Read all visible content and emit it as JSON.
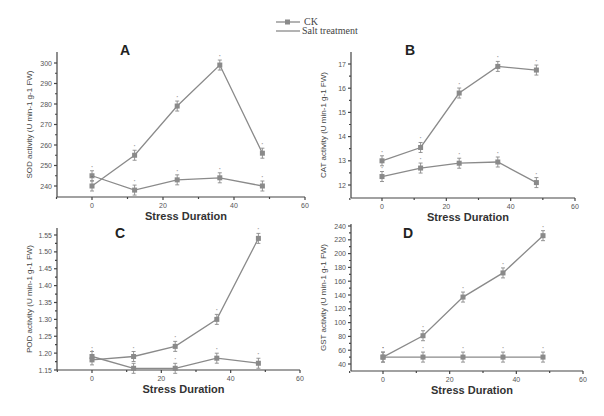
{
  "legend": {
    "entries": [
      {
        "label": "CK",
        "marker": "square"
      },
      {
        "label": "Salt treatment",
        "marker": "none"
      }
    ]
  },
  "chart_data": [
    {
      "panel": "A",
      "type": "line",
      "title": "A",
      "xlabel": "Stress Duration",
      "ylabel": "SOD activity (U min-1 g-1 FW)",
      "x": [
        0,
        12,
        24,
        36,
        48
      ],
      "xlim": [
        -10,
        60
      ],
      "xticks": [
        0,
        20,
        40,
        60
      ],
      "ylim": [
        236,
        302
      ],
      "yticks": [
        240,
        250,
        260,
        270,
        280,
        290,
        300
      ],
      "series": [
        {
          "name": "CK",
          "values": [
            245,
            238,
            243,
            244,
            240
          ]
        },
        {
          "name": "Salt treatment",
          "values": [
            240,
            255,
            279,
            299,
            256
          ]
        }
      ]
    },
    {
      "panel": "B",
      "type": "line",
      "title": "B",
      "xlabel": "Stress Duration",
      "ylabel": "CAT activity (U min-1 g-1 FW)",
      "x": [
        0,
        12,
        24,
        36,
        48
      ],
      "xlim": [
        -10,
        60
      ],
      "xticks": [
        0,
        20,
        40,
        60
      ],
      "ylim": [
        11.5,
        17.4
      ],
      "yticks": [
        12,
        13,
        14,
        15,
        16,
        17
      ],
      "series": [
        {
          "name": "CK",
          "values": [
            12.35,
            12.7,
            12.9,
            12.95,
            12.1
          ]
        },
        {
          "name": "Salt treatment",
          "values": [
            13.0,
            13.55,
            15.8,
            16.9,
            16.75
          ]
        }
      ]
    },
    {
      "panel": "C",
      "type": "line",
      "title": "C",
      "xlabel": "Stress Duration",
      "ylabel": "POD activity (U min-1 g-1 FW)",
      "x": [
        0,
        12,
        24,
        36,
        48
      ],
      "xlim": [
        -10,
        60
      ],
      "xticks": [
        0,
        20,
        40,
        60
      ],
      "ylim": [
        1.15,
        1.56
      ],
      "yticks": [
        1.15,
        1.2,
        1.25,
        1.3,
        1.35,
        1.4,
        1.45,
        1.5,
        1.55
      ],
      "series": [
        {
          "name": "CK",
          "values": [
            1.19,
            1.155,
            1.155,
            1.185,
            1.17
          ]
        },
        {
          "name": "Salt treatment",
          "values": [
            1.18,
            1.19,
            1.22,
            1.3,
            1.54
          ]
        }
      ]
    },
    {
      "panel": "D",
      "type": "line",
      "title": "D",
      "xlabel": "Stress Duration",
      "ylabel": "GST activity (U min-1 g-1 FW)",
      "x": [
        0,
        12,
        24,
        36,
        48
      ],
      "xlim": [
        -10,
        60
      ],
      "xticks": [
        0,
        20,
        40,
        60
      ],
      "ylim": [
        30,
        240
      ],
      "yticks": [
        40,
        60,
        80,
        100,
        120,
        140,
        160,
        180,
        200,
        220,
        240
      ],
      "series": [
        {
          "name": "CK",
          "values": [
            50,
            50,
            50,
            50,
            50
          ]
        },
        {
          "name": "Salt treatment",
          "values": [
            50,
            81,
            137,
            172,
            226
          ]
        }
      ]
    }
  ],
  "layout": {
    "panels": [
      {
        "x0": 57,
        "x1": 305,
        "y0": 52,
        "y1": 197,
        "xAt0": 92,
        "xAt60": 305,
        "yPix": [
          [
            240,
            186
          ],
          [
            300,
            63
          ]
        ],
        "decimals": 0,
        "letterX": 120,
        "letterY": 55
      },
      {
        "x0": 351,
        "x1": 575,
        "y0": 52,
        "y1": 198,
        "xAt0": 382,
        "xAt60": 575,
        "yPix": [
          [
            12,
            185
          ],
          [
            17,
            64
          ]
        ],
        "decimals": 0,
        "letterX": 405,
        "letterY": 55
      },
      {
        "x0": 57,
        "x1": 300,
        "y0": 228,
        "y1": 370,
        "xAt0": 92,
        "xAt60": 300,
        "yPix": [
          [
            1.15,
            370
          ],
          [
            1.55,
            235
          ]
        ],
        "decimals": 2,
        "letterX": 115,
        "letterY": 238
      },
      {
        "x0": 351,
        "x1": 583,
        "y0": 224,
        "y1": 371,
        "xAt0": 383,
        "xAt60": 583,
        "yPix": [
          [
            40,
            364
          ],
          [
            240,
            226
          ]
        ],
        "decimals": 0,
        "letterX": 403,
        "letterY": 238
      }
    ],
    "series_color": "#8a8a8a",
    "axis_color": "#444444"
  }
}
